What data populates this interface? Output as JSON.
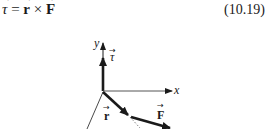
{
  "equation": {
    "text": "τ = r × F",
    "lhs": "τ",
    "equals": "=",
    "r": "r",
    "times": "×",
    "F": "F",
    "number": "(10.19)"
  },
  "figure": {
    "labels": {
      "y_axis": "y",
      "x_axis": "x",
      "tau": "τ",
      "r": "r",
      "F": "F",
      "vector_arrow": "→"
    },
    "colors": {
      "ink": "#1a1a1a",
      "background": "#ffffff"
    }
  }
}
